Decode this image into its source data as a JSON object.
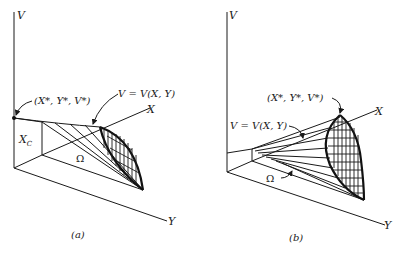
{
  "figure": {
    "panels": [
      {
        "id": "a",
        "caption": "(a)",
        "axis_labels": {
          "v": "V",
          "x": "X",
          "y": "Y"
        },
        "annotations": {
          "optimum_point": "(X*, Y*, V*)",
          "surface": "V = V(X, Y)",
          "region": "Ω",
          "constraint": "X",
          "constraint_sub": "C"
        }
      },
      {
        "id": "b",
        "caption": "(b)",
        "axis_labels": {
          "v": "V",
          "x": "X",
          "y": "Y"
        },
        "annotations": {
          "optimum_point": "(X*, Y*, V*)",
          "surface": "V = V(X, Y)",
          "region": "Ω"
        }
      }
    ]
  }
}
